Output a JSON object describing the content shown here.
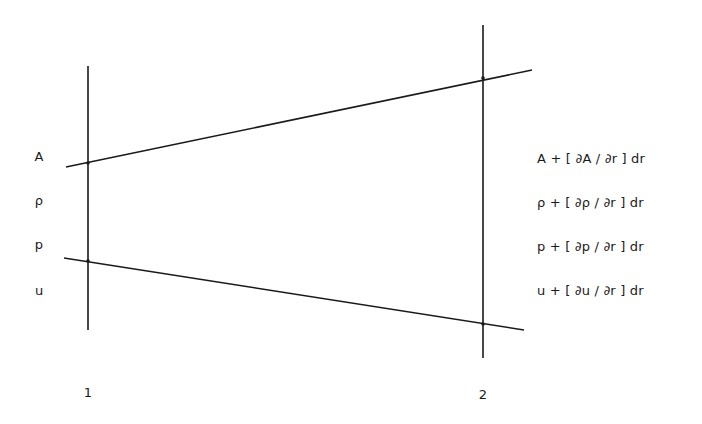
{
  "diagram": {
    "colors": {
      "line": "#1a1a1a",
      "background": "#ffffff"
    },
    "stations": [
      {
        "id": "1",
        "label": "1",
        "x": 88,
        "y_top": 66,
        "y_bottom": 330
      },
      {
        "id": "2",
        "label": "2",
        "x": 483,
        "y_top": 25,
        "y_bottom": 358
      }
    ],
    "boundary_lines": {
      "upper": {
        "x1": 66,
        "y1": 167,
        "x2": 532,
        "y2": 70
      },
      "lower": {
        "x1": 64,
        "y1": 258,
        "x2": 524,
        "y2": 330
      }
    },
    "station_1_variables": [
      "A",
      "ρ",
      "p",
      "u"
    ],
    "station_2_expressions": [
      "A + [ ∂A / ∂r ] dr",
      "ρ + [ ∂ρ / ∂r ] dr",
      "p + [ ∂p / ∂r ] dr",
      "u + [ ∂u / ∂r ] dr"
    ]
  }
}
